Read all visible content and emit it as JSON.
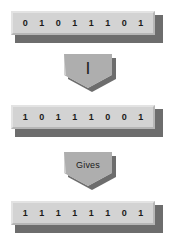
{
  "diagram": {
    "colors": {
      "face": "#d3d3d3",
      "shadow": "#6d6d6d",
      "edge": "#aeaeae",
      "text": "#1a1a1a",
      "background": "#ffffff"
    },
    "operand_a": {
      "label": "operand-a",
      "bits": [
        "0",
        "1",
        "0",
        "1",
        "1",
        "1",
        "0",
        "1"
      ]
    },
    "operator": {
      "label": "|",
      "name": "bitwise-or"
    },
    "operand_b": {
      "label": "operand-b",
      "bits": [
        "1",
        "0",
        "1",
        "1",
        "1",
        "0",
        "0",
        "1"
      ]
    },
    "gives": {
      "label": "Gives",
      "name": "result-arrow"
    },
    "result": {
      "label": "result",
      "bits": [
        "1",
        "1",
        "1",
        "1",
        "1",
        "1",
        "0",
        "1"
      ]
    }
  }
}
